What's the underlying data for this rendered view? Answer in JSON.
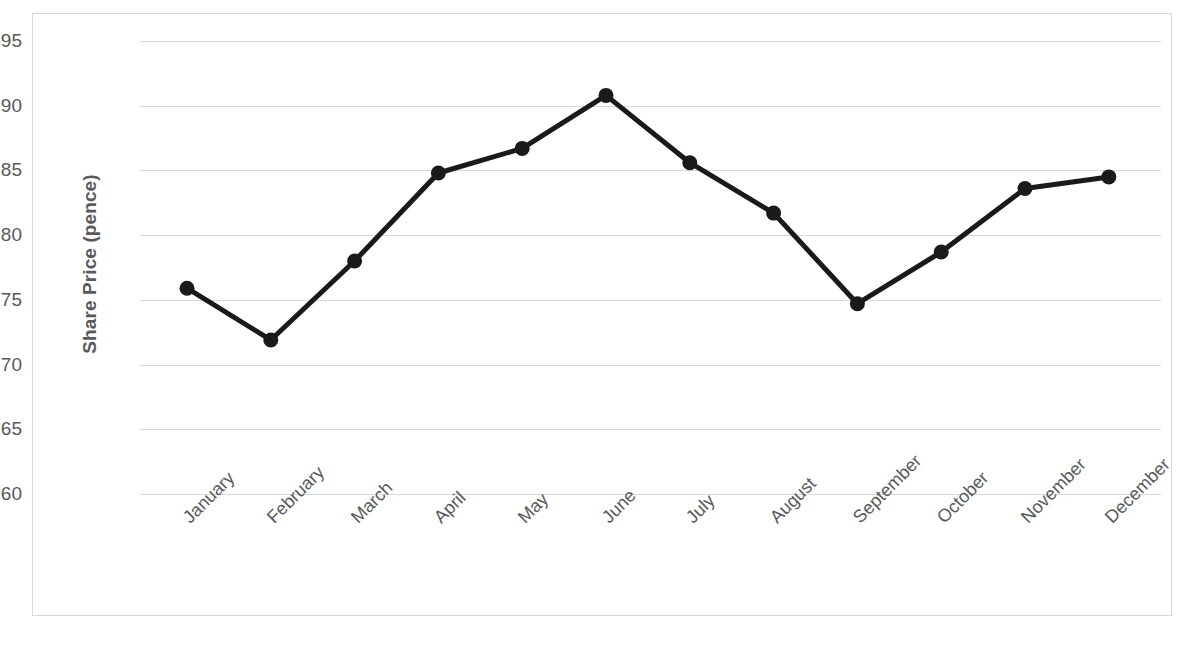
{
  "chart_data": {
    "type": "line",
    "title": "",
    "xlabel": "",
    "ylabel": "Share Price (pence)",
    "categories": [
      "January",
      "February",
      "March",
      "April",
      "May",
      "June",
      "July",
      "August",
      "September",
      "October",
      "November",
      "December"
    ],
    "values": [
      75.9,
      71.9,
      78.0,
      84.8,
      86.7,
      90.8,
      85.6,
      81.7,
      74.7,
      78.7,
      83.6,
      84.5
    ],
    "series": [
      {
        "name": "Share Price",
        "values": [
          75.9,
          71.9,
          78.0,
          84.8,
          86.7,
          90.8,
          85.6,
          81.7,
          74.7,
          78.7,
          83.6,
          84.5
        ]
      }
    ],
    "ylim": [
      60,
      95
    ],
    "yticks": [
      95,
      90,
      85,
      80,
      75,
      70,
      65,
      60
    ],
    "ytick_labels": [
      "95",
      "90",
      "85",
      "80",
      "75",
      "70",
      "65",
      "60"
    ],
    "grid": true,
    "legend": "none",
    "line_color": "#1a1a1a",
    "marker_color": "#1a1a1a",
    "gridline_color": "#d9d9d9",
    "text_color": "#595959",
    "background_color": "#ffffff",
    "border_color": "#d9d9d9",
    "xtick_rotation": -45
  },
  "artifact": {
    "bottom_left_text": ""
  }
}
